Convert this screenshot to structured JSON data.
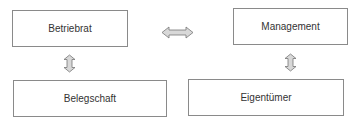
{
  "diagram": {
    "nodes": [
      {
        "id": "betriebrat",
        "label": "Betriebrat"
      },
      {
        "id": "belegschaft",
        "label": "Belegschaft"
      },
      {
        "id": "management",
        "label": "Management"
      },
      {
        "id": "eigentuemer",
        "label": "Eigentümer"
      }
    ],
    "edges": [
      {
        "from": "betriebrat",
        "to": "management",
        "type": "bidirectional",
        "orientation": "horizontal"
      },
      {
        "from": "betriebrat",
        "to": "belegschaft",
        "type": "bidirectional",
        "orientation": "vertical"
      },
      {
        "from": "management",
        "to": "eigentuemer",
        "type": "bidirectional",
        "orientation": "vertical"
      }
    ],
    "colors": {
      "border": "#8a8a8a",
      "arrow_fill": "#d8d8d8",
      "arrow_stroke": "#777777",
      "text": "#333333"
    }
  }
}
